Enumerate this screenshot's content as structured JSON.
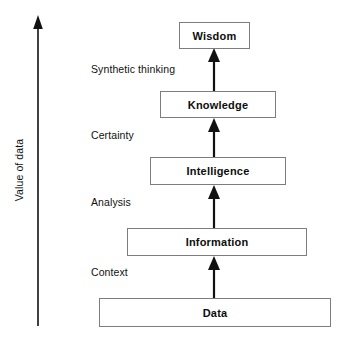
{
  "diagram": {
    "type": "flow-pyramid",
    "colors": {
      "background": "#ffffff",
      "box_border": "#7d7d7d",
      "text": "#0d0d0d",
      "arrow": "#111111"
    },
    "axis": {
      "label": "Value of data",
      "direction": "up",
      "icon": "up-arrow-icon"
    },
    "levels": [
      {
        "id": "wisdom",
        "label": "Wisdom",
        "rank": 5,
        "x": 179,
        "y": 22,
        "width": 71,
        "height": 27
      },
      {
        "id": "knowledge",
        "label": "Knowledge",
        "rank": 4,
        "x": 160,
        "y": 91,
        "width": 116,
        "height": 27
      },
      {
        "id": "intelligence",
        "label": "Intelligence",
        "rank": 3,
        "x": 150,
        "y": 157,
        "width": 136,
        "height": 28
      },
      {
        "id": "information",
        "label": "Information",
        "rank": 2,
        "x": 127,
        "y": 228,
        "width": 180,
        "height": 28
      },
      {
        "id": "data",
        "label": "Data",
        "rank": 1,
        "x": 99,
        "y": 298,
        "width": 232,
        "height": 29
      }
    ],
    "transitions": [
      {
        "id": "synthetic-thinking",
        "label": "Synthetic thinking",
        "from": "knowledge",
        "to": "wisdom",
        "x": 91,
        "y": 63
      },
      {
        "id": "certainty",
        "label": "Certainty",
        "from": "intelligence",
        "to": "knowledge",
        "x": 91,
        "y": 129
      },
      {
        "id": "analysis",
        "label": "Analysis",
        "from": "information",
        "to": "intelligence",
        "x": 91,
        "y": 196
      },
      {
        "id": "context",
        "label": "Context",
        "from": "data",
        "to": "information",
        "x": 91,
        "y": 266
      }
    ],
    "connectors": [
      {
        "id": "arrow-knowledge-to-wisdom",
        "icon": "up-arrow-icon",
        "cx": 214,
        "top": 49,
        "bottom": 91
      },
      {
        "id": "arrow-intelligence-to-knowledge",
        "icon": "up-arrow-icon",
        "cx": 214,
        "top": 118,
        "bottom": 157
      },
      {
        "id": "arrow-information-to-intelligence",
        "icon": "up-arrow-icon",
        "cx": 214,
        "top": 185,
        "bottom": 228
      },
      {
        "id": "arrow-data-to-information",
        "icon": "up-arrow-icon",
        "cx": 214,
        "top": 256,
        "bottom": 298
      }
    ]
  }
}
